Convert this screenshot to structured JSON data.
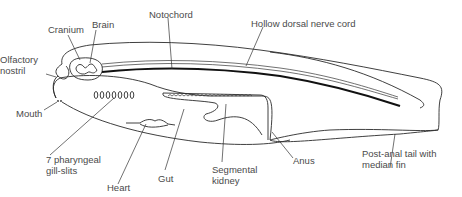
{
  "diagram": {
    "labels": {
      "cranium": "Cranium",
      "brain": "Brain",
      "notochord": "Notochord",
      "hollow_dorsal_nerve_cord": "Hollow dorsal nerve cord",
      "olfactory_nostril_1": "Olfactory",
      "olfactory_nostril_2": "nostril",
      "mouth": "Mouth",
      "gill_slits_1": "7 pharyngeal",
      "gill_slits_2": "gill-slits",
      "heart": "Heart",
      "gut": "Gut",
      "segmental_kidney_1": "Segmental",
      "segmental_kidney_2": "kidney",
      "anus": "Anus",
      "tail_1": "Post-anal tail with",
      "tail_2": "median fin"
    },
    "gill_slit_count": 7,
    "colors": {
      "line": "#2a2a2a",
      "label_text": "#4a4a4a",
      "background": "#ffffff"
    }
  }
}
